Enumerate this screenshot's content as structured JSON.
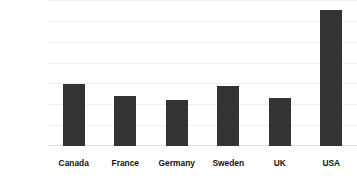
{
  "chart_data": {
    "type": "bar",
    "title": "",
    "title_note": "title row is cropped off the top edge of the screenshot and is not legible",
    "xlabel": "",
    "ylabel": "",
    "categories": [
      "Canada",
      "France",
      "Germany",
      "Sweden",
      "UK",
      "USA"
    ],
    "values": [
      590,
      480,
      440,
      580,
      460,
      1305
    ],
    "ylim": [
      0,
      1400
    ],
    "ytick_values": [
      1400,
      1200,
      1000,
      800,
      600,
      400,
      200
    ],
    "ytick_labels": [
      "$1,400",
      "$1,200",
      "$1,000",
      "$800",
      "$600",
      "$400",
      "$200"
    ],
    "grid": true,
    "legend": false,
    "bar_color": "#333333",
    "background_color": "#ffffff"
  }
}
